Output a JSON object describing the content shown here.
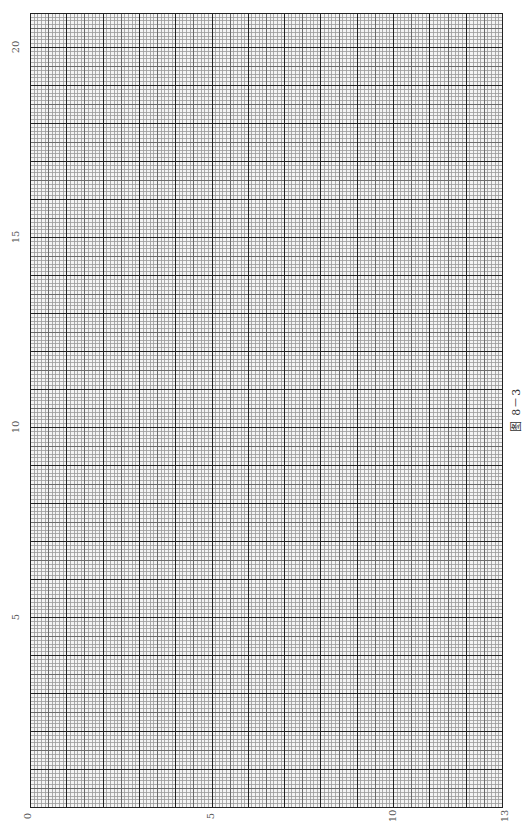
{
  "caption": "图 8－3",
  "colors": {
    "minor": "#9a9a9a",
    "medium": "#6a6a6a",
    "major": "#222222",
    "border": "#222222",
    "label": "#555555"
  },
  "chart_data": {
    "type": "grid",
    "title": "图 8－3",
    "x_axis": {
      "position": "bottom",
      "range": [
        0,
        13
      ],
      "tick_labels": [
        "0",
        "5",
        "10",
        "13"
      ],
      "tick_values": [
        0,
        5,
        10,
        13
      ],
      "label_rotation": -90
    },
    "y_axis": {
      "position": "left",
      "range": [
        0,
        20.9
      ],
      "tick_labels": [
        "5",
        "10",
        "15",
        "20"
      ],
      "tick_values": [
        5,
        10,
        15,
        20
      ],
      "label_rotation": -90
    },
    "minor_divisions_per_unit": 10,
    "medium_line_every": 5,
    "grid": true,
    "series": []
  },
  "layout": {
    "grid_left": 30,
    "grid_top": 13,
    "grid_right": 502,
    "grid_bottom": 807,
    "x_units": 13,
    "y_unit_px": 38.0
  },
  "labels": {
    "x0": "0",
    "x5": "5",
    "x10": "10",
    "x13": "13",
    "y5": "5",
    "y10": "10",
    "y15": "15",
    "y20": "20"
  }
}
